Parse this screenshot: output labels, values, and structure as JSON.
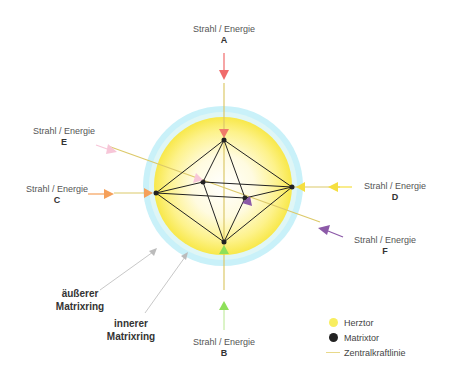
{
  "beams": [
    {
      "id": "A",
      "label": "Strahl / Energie",
      "letter": "A",
      "color": "#f06a6a"
    },
    {
      "id": "B",
      "label": "Strahl / Energie",
      "letter": "B",
      "color": "#8ee05a"
    },
    {
      "id": "C",
      "label": "Strahl / Energie",
      "letter": "C",
      "color": "#f5a05a"
    },
    {
      "id": "D",
      "label": "Strahl / Energie",
      "letter": "D",
      "color": "#f5df40"
    },
    {
      "id": "E",
      "label": "Strahl / Energie",
      "letter": "E",
      "color": "#f7c6d8"
    },
    {
      "id": "F",
      "label": "Strahl / Energie",
      "letter": "F",
      "color": "#8c5aa8"
    }
  ],
  "rings": {
    "outer": {
      "line1": "äußerer",
      "line2": "Matrixring",
      "color": "#c8f0f8"
    },
    "inner": {
      "line1": "innerer",
      "line2": "Matrixring",
      "color": "#fbf060"
    }
  },
  "legend": {
    "items": [
      {
        "label": "Herztor",
        "color": "#f8ee60"
      },
      {
        "label": "Matrixtor",
        "color": "#222222"
      },
      {
        "label": "Zentralkraftlinie",
        "color": "#f0e08a"
      }
    ]
  },
  "colors": {
    "line": "#d8c870",
    "edge": "#222222",
    "pointer": "#bbbbbb"
  }
}
